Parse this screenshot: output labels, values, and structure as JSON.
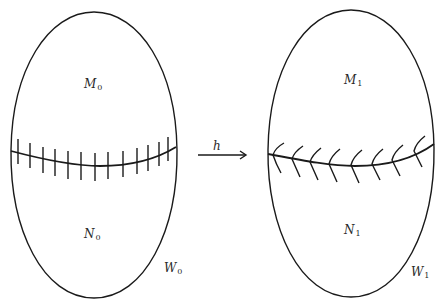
{
  "figure": {
    "background": "#ffffff",
    "stroke_color": "#1a1a1a",
    "left_manifold": {
      "name": "W",
      "subscript": "0",
      "upper_region": {
        "name": "M",
        "subscript": "0"
      },
      "lower_region": {
        "name": "N",
        "subscript": "0"
      },
      "hypersurface_marking": "vertical-ticks",
      "tick_count": 13
    },
    "map": {
      "label": "h",
      "direction": "left-to-right"
    },
    "right_manifold": {
      "name": "W",
      "subscript": "1",
      "upper_region": {
        "name": "M",
        "subscript": "1"
      },
      "lower_region": {
        "name": "N",
        "subscript": "1"
      },
      "hypersurface_marking": "chevrons",
      "chevron_count": 8
    }
  }
}
